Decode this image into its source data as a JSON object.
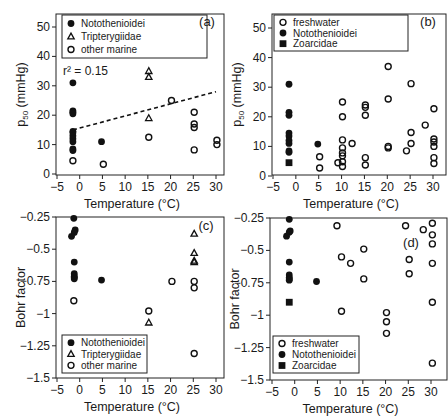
{
  "figure": {
    "panels": [
      "a",
      "b",
      "c",
      "d"
    ]
  },
  "chart_data": [
    {
      "panel": "a",
      "label": "(a)",
      "type": "scatter",
      "xlabel": "Temperature (°C)",
      "ylabel": "P50 (mmHg)",
      "xlim": [
        -5,
        32
      ],
      "ylim": [
        0,
        55
      ],
      "xticks": [
        -5,
        0,
        5,
        10,
        15,
        20,
        25,
        30
      ],
      "yticks": [
        0,
        10,
        20,
        30,
        40,
        50
      ],
      "annotation": "r² = 0.15",
      "legend_position": "upper left",
      "trendline": {
        "style": "dashed",
        "x": [
          -1.5,
          30
        ],
        "y": [
          15,
          28
        ]
      },
      "series": [
        {
          "name": "Notothenioidei",
          "marker": "filled-circle",
          "points": [
            [
              -1.5,
              31
            ],
            [
              -1.5,
              21.5
            ],
            [
              -1.5,
              21
            ],
            [
              -1.5,
              20.5
            ],
            [
              -1.5,
              14.5
            ],
            [
              -1.5,
              14
            ],
            [
              -1.5,
              13
            ],
            [
              -1.5,
              12
            ],
            [
              -1.5,
              11
            ],
            [
              -1.5,
              8.5
            ],
            [
              -1.5,
              8
            ],
            [
              4.8,
              11
            ]
          ]
        },
        {
          "name": "Tripterygiidae",
          "marker": "open-triangle",
          "points": [
            [
              15.2,
              41.5
            ],
            [
              15.2,
              35
            ],
            [
              15.2,
              33
            ],
            [
              15.2,
              19
            ],
            [
              25.2,
              50
            ],
            [
              25.2,
              47.5
            ],
            [
              25.2,
              41.5
            ]
          ]
        },
        {
          "name": "other marine",
          "marker": "open-circle",
          "points": [
            [
              -1.5,
              4.5
            ],
            [
              5.2,
              3.3
            ],
            [
              15.2,
              12.5
            ],
            [
              20.2,
              25
            ],
            [
              25.2,
              21
            ],
            [
              25.2,
              17
            ],
            [
              25.2,
              15.8
            ],
            [
              25.2,
              8.2
            ],
            [
              30.2,
              11.5
            ],
            [
              30.2,
              10
            ]
          ]
        }
      ]
    },
    {
      "panel": "b",
      "label": "(b)",
      "type": "scatter",
      "xlabel": "Temperature (°C)",
      "ylabel": "P50 (mmHg)",
      "xlim": [
        -5,
        32
      ],
      "ylim": [
        0,
        55
      ],
      "xticks": [
        -5,
        0,
        5,
        10,
        15,
        20,
        25,
        30
      ],
      "yticks": [
        0,
        10,
        20,
        30,
        40,
        50
      ],
      "legend_position": "upper left",
      "series": [
        {
          "name": "freshwater",
          "marker": "open-circle",
          "points": [
            [
              5.2,
              6.5
            ],
            [
              5.2,
              2.7
            ],
            [
              9.2,
              4.5
            ],
            [
              10.2,
              25
            ],
            [
              10.2,
              20
            ],
            [
              10.2,
              12.2
            ],
            [
              10.2,
              9.5
            ],
            [
              10.2,
              7.8
            ],
            [
              10.2,
              6.8
            ],
            [
              10.2,
              4.8
            ],
            [
              10.2,
              3.2
            ],
            [
              12.3,
              11
            ],
            [
              15.2,
              24
            ],
            [
              15.2,
              23.2
            ],
            [
              15.2,
              20.5
            ],
            [
              15.2,
              6.2
            ],
            [
              15.2,
              3.7
            ],
            [
              20.2,
              37
            ],
            [
              20.2,
              26
            ],
            [
              20.2,
              10
            ],
            [
              20.2,
              9.5
            ],
            [
              24.2,
              8.5
            ],
            [
              25.2,
              31.2
            ],
            [
              25.2,
              14.7
            ],
            [
              25.2,
              11
            ],
            [
              28.3,
              17.2
            ],
            [
              30.2,
              22.7
            ],
            [
              30.2,
              12.5
            ],
            [
              30.2,
              11.5
            ],
            [
              30.2,
              10
            ],
            [
              30.2,
              6.2
            ],
            [
              30.2,
              4.2
            ]
          ]
        },
        {
          "name": "Notothenioidei",
          "marker": "filled-circle",
          "points": [
            [
              -1.5,
              31
            ],
            [
              -1.5,
              21.5
            ],
            [
              -1.5,
              20.5
            ],
            [
              -1.5,
              14.5
            ],
            [
              -1.5,
              13.5
            ],
            [
              -1.5,
              12
            ],
            [
              -1.5,
              11
            ],
            [
              -1.5,
              8.5
            ],
            [
              -1.5,
              8
            ],
            [
              4.8,
              10.8
            ]
          ]
        },
        {
          "name": "Zoarcidae",
          "marker": "filled-square",
          "points": [
            [
              -1.5,
              4.5
            ]
          ]
        }
      ]
    },
    {
      "panel": "c",
      "label": "(c)",
      "type": "scatter",
      "xlabel": "Temperature (°C)",
      "ylabel": "Bohr factor",
      "xlim": [
        -5,
        32
      ],
      "ylim": [
        -1.5,
        -0.25
      ],
      "xticks": [
        -5,
        0,
        5,
        10,
        15,
        20,
        25,
        30
      ],
      "yticks": [
        -0.25,
        -0.5,
        -0.75,
        -1,
        -1.25,
        -1.5
      ],
      "legend_position": "lower left",
      "series": [
        {
          "name": "Notothenioidei",
          "marker": "filled-circle",
          "points": [
            [
              -1.3,
              -0.26
            ],
            [
              -1,
              -0.35
            ],
            [
              -1.2,
              -0.37
            ],
            [
              -1.8,
              -0.4
            ],
            [
              -1.2,
              -0.6
            ],
            [
              -1.2,
              -0.69
            ],
            [
              -1.2,
              -0.71
            ],
            [
              -1.2,
              -0.72
            ],
            [
              -1.2,
              -0.73
            ],
            [
              4.8,
              -0.74
            ]
          ]
        },
        {
          "name": "Tripterygiidae",
          "marker": "open-triangle",
          "points": [
            [
              15.2,
              -1.07
            ],
            [
              25.2,
              -0.38
            ],
            [
              25.2,
              -0.53
            ],
            [
              25.2,
              -0.59
            ],
            [
              25.2,
              -0.6
            ]
          ]
        },
        {
          "name": "other marine",
          "marker": "open-circle",
          "points": [
            [
              -1.3,
              -0.9
            ],
            [
              15.2,
              -0.98
            ],
            [
              20.3,
              -0.75
            ],
            [
              25.2,
              -0.75
            ],
            [
              25.2,
              -0.8
            ],
            [
              25.2,
              -1.31
            ]
          ]
        }
      ]
    },
    {
      "panel": "d",
      "label": "(d)",
      "type": "scatter",
      "xlabel": "Temperature (°C)",
      "ylabel": "Bohr factor",
      "xlim": [
        -5,
        32
      ],
      "ylim": [
        -1.5,
        -0.25
      ],
      "xticks": [
        -5,
        0,
        5,
        10,
        15,
        20,
        25,
        30
      ],
      "yticks": [
        -0.25,
        -0.5,
        -0.75,
        -1,
        -1.25,
        -1.5
      ],
      "legend_position": "lower left",
      "series": [
        {
          "name": "freshwater",
          "marker": "open-circle",
          "points": [
            [
              9.3,
              -0.31
            ],
            [
              10.3,
              -0.55
            ],
            [
              10.3,
              -0.97
            ],
            [
              12.3,
              -0.6
            ],
            [
              15.2,
              -0.49
            ],
            [
              15.2,
              -0.72
            ],
            [
              20.2,
              -0.98
            ],
            [
              20.2,
              -1.05
            ],
            [
              20.2,
              -1.14
            ],
            [
              24.4,
              -0.31
            ],
            [
              25.2,
              -0.57
            ],
            [
              25.2,
              -0.68
            ],
            [
              28.3,
              -0.34
            ],
            [
              30.3,
              -0.29
            ],
            [
              30.3,
              -0.38
            ],
            [
              30.3,
              -0.45
            ],
            [
              30.3,
              -0.6
            ],
            [
              30.3,
              -0.9
            ],
            [
              30.3,
              -1.37
            ]
          ]
        },
        {
          "name": "Notothenioidei",
          "marker": "filled-circle",
          "points": [
            [
              -1.2,
              -0.26
            ],
            [
              -1,
              -0.35
            ],
            [
              -1.2,
              -0.36
            ],
            [
              -1.8,
              -0.39
            ],
            [
              -1.2,
              -0.59
            ],
            [
              -1.2,
              -0.69
            ],
            [
              -1.2,
              -0.71
            ],
            [
              -1.2,
              -0.72
            ],
            [
              -1.2,
              -0.73
            ],
            [
              4.8,
              -0.74
            ]
          ]
        },
        {
          "name": "Zoarcidae",
          "marker": "filled-square",
          "points": [
            [
              -1.2,
              -0.9
            ]
          ]
        }
      ]
    }
  ],
  "labels": {
    "x_axis": "Temperature (°C)",
    "y_axis_top": "P50 (mmHg)",
    "y_axis_bottom": "Bohr factor",
    "r2": "r² = 0.15"
  }
}
